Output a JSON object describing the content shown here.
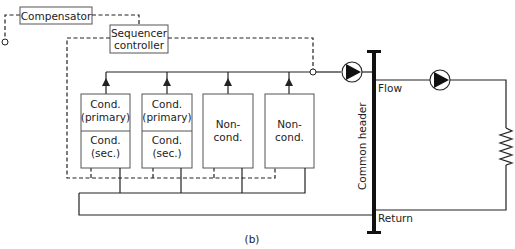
{
  "diagram": {
    "caption": "(b)",
    "compensator": {
      "label": "Compensator"
    },
    "sequencer": {
      "line1": "Sequencer",
      "line2": "controller"
    },
    "boilers": [
      {
        "top": [
          "Cond.",
          "(primary)"
        ],
        "bottom": [
          "Cond.",
          "(sec.)"
        ],
        "type": "condensing"
      },
      {
        "top": [
          "Cond.",
          "(primary)"
        ],
        "bottom": [
          "Cond.",
          "(sec.)"
        ],
        "type": "condensing"
      },
      {
        "top": [
          "Non-",
          "cond."
        ],
        "type": "non-condensing"
      },
      {
        "top": [
          "Non-",
          "cond."
        ],
        "type": "non-condensing"
      }
    ],
    "header": {
      "label": "Common header"
    },
    "flow_label": "Flow",
    "return_label": "Return",
    "components": [
      "outdoor-sensor",
      "flow-sensor",
      "primary-pump",
      "secondary-pump",
      "load-resistor"
    ]
  }
}
